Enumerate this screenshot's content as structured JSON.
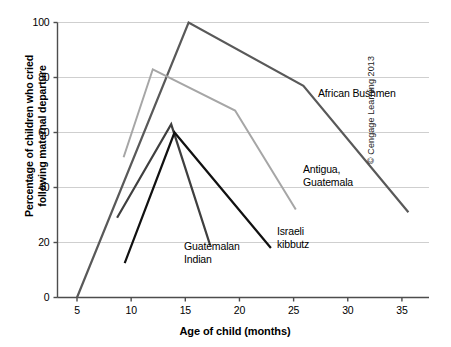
{
  "chart_data": {
    "type": "line",
    "title": "",
    "xlabel": "Age of child (months)",
    "ylabel": "Percentage of children who cried\nfollowing maternal departure",
    "xlim": [
      3.2,
      37.5
    ],
    "ylim": [
      0,
      100
    ],
    "xticks": [
      5,
      10,
      15,
      20,
      25,
      30,
      35
    ],
    "yticks": [
      0,
      20,
      40,
      60,
      80,
      100
    ],
    "grid": "horizontal",
    "legend_position": "inline-annotations",
    "series": [
      {
        "name": "African Bushmen",
        "color": "#595959",
        "width": 2.2,
        "label_position": "right-of-line",
        "points": [
          {
            "x": 5.0,
            "y": 0
          },
          {
            "x": 15.3,
            "y": 100
          },
          {
            "x": 25.9,
            "y": 77
          },
          {
            "x": 35.6,
            "y": 31
          }
        ]
      },
      {
        "name": "Antigua,\nGuatemala",
        "color": "#a6a6a6",
        "width": 2.0,
        "label_position": "right-of-line",
        "points": [
          {
            "x": 9.3,
            "y": 51
          },
          {
            "x": 12.0,
            "y": 83
          },
          {
            "x": 19.6,
            "y": 68
          },
          {
            "x": 25.2,
            "y": 32
          }
        ]
      },
      {
        "name": "Guatemalan\nIndian",
        "color": "#3f3f3f",
        "width": 2.2,
        "label_position": "below-line",
        "points": [
          {
            "x": 8.7,
            "y": 29
          },
          {
            "x": 13.7,
            "y": 63
          },
          {
            "x": 17.3,
            "y": 19
          }
        ]
      },
      {
        "name": "Israeli\nkibbutz",
        "color": "#111111",
        "width": 2.2,
        "label_position": "right-of-line",
        "points": [
          {
            "x": 9.4,
            "y": 12.5
          },
          {
            "x": 14.0,
            "y": 60
          },
          {
            "x": 22.9,
            "y": 18
          }
        ]
      }
    ]
  },
  "annotations": {
    "copyright": "© Cengage Learning 2013"
  },
  "axis": {
    "axis_color": "#4d4d4d",
    "grid_color": "#cfcfcf"
  }
}
